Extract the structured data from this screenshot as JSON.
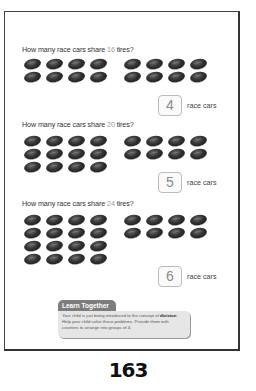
{
  "problems": [
    {
      "question_prefix": "How many race cars share ",
      "number": "16",
      "question_suffix": " tires?",
      "tire_count": 16,
      "answer": "4",
      "answer_label": "race cars"
    },
    {
      "question_prefix": "How many race cars share ",
      "number": "20",
      "question_suffix": " tires?",
      "tire_count": 20,
      "answer": "5",
      "answer_label": "race cars"
    },
    {
      "question_prefix": "How many race cars share ",
      "number": "24",
      "question_suffix": " tires?",
      "tire_count": 24,
      "answer": "6",
      "answer_label": "race cars"
    }
  ],
  "learn_together": {
    "title": "Learn Together",
    "text_before": "Your child is just being introduced to the concept of ",
    "bold_word": "division",
    "text_after": ". Help your child solve these problems. Provide them with counters to arrange into groups of 4."
  },
  "page_number": "163"
}
